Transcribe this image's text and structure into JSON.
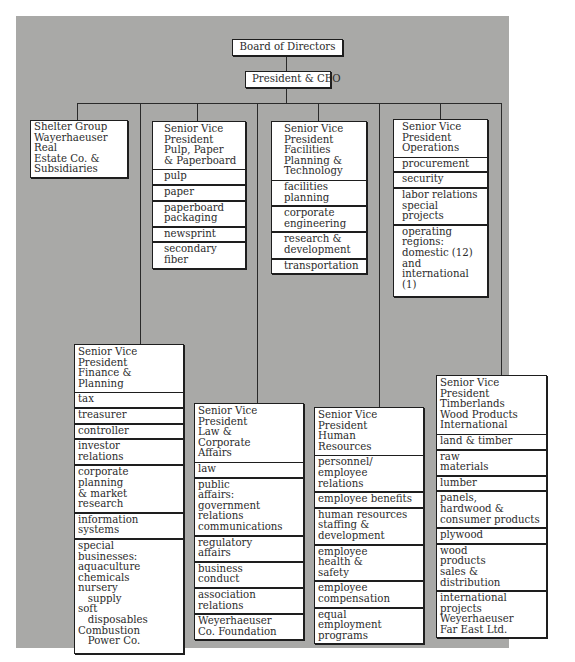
{
  "chart": {
    "root": "Board of Directors",
    "ceo": "President & CEO",
    "shelter": {
      "title": "Shelter Group\nWayerhaeuser Real\nEstate Co. &\nSubsidiaries"
    },
    "pulp": {
      "title": "Senior Vice\nPresident\nPulp, Paper\n& Paperboard",
      "items": [
        "pulp",
        "paper",
        "paperboard\npackaging",
        "newsprint",
        "secondary\nfiber"
      ]
    },
    "facilities": {
      "title": "Senior Vice\nPresident\nFacilities\nPlanning &\nTechnology",
      "items": [
        "facilities\nplanning",
        "corporate\nengineering",
        "research &\ndevelopment",
        "transportation"
      ]
    },
    "operations": {
      "title": "Senior Vice\nPresident\nOperations",
      "items": [
        "procurement",
        "security",
        "labor relations\nspecial projects",
        "operating\nregions:\ndomestic (12)\nand\ninternational (1)"
      ]
    },
    "finance": {
      "title": "Senior Vice President\nFinance &\nPlanning",
      "items": [
        "tax",
        "treasurer",
        "controller",
        "investor\nrelations",
        "corporate\nplanning\n& market\nresearch",
        "information\nsystems",
        "special\nbusinesses:\naquaculture\nchemicals\nnursery\n   supply\nsoft\n   disposables\nCombustion\n   Power Co."
      ]
    },
    "law": {
      "title": "Senior Vice President\nLaw &\nCorporate\nAffairs",
      "items": [
        "law",
        "public\naffairs:\ngovernment\nrelations\ncommunications",
        "regulatory\naffairs",
        "business\nconduct",
        "association\nrelations",
        "Weyerhaeuser\nCo. Foundation"
      ]
    },
    "hr": {
      "title": "Senior Vice President\nHuman\nResources",
      "items": [
        "personnel/\nemployee\nrelations",
        "employee benefits",
        "human resources\nstaffing &\ndevelopment",
        "employee\nhealth &\nsafety",
        "employee\ncompensation",
        "equal\nemployment\nprograms"
      ]
    },
    "timberlands": {
      "title": "Senior Vice President\nTimberlands\nWood Products\nInternational",
      "items": [
        "land & timber",
        "raw\nmaterials",
        "lumber",
        "panels,\nhardwood &\nconsumer products",
        "plywood",
        "wood\nproducts\nsales &\ndistribution",
        "international\nprojects\nWeyerhaeuser\nFar East Ltd."
      ]
    }
  },
  "colors": {
    "background": "#a9a9a7",
    "box": "#ffffff",
    "line": "#1e1e1e"
  }
}
